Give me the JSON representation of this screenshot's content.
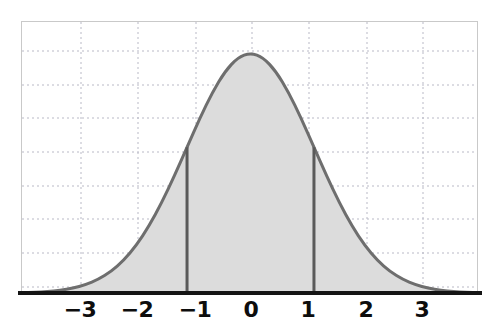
{
  "figure": {
    "kind": "normal-distribution-plot",
    "background_color": "#ffffff"
  },
  "chart_data": {
    "type": "area",
    "title": "",
    "subtitle": "",
    "xlabel": "",
    "ylabel": "",
    "xlim": [
      -3.6,
      3.6
    ],
    "ylim": [
      0.0,
      0.45
    ],
    "grid": true,
    "grid_style": "dotted",
    "grid_color": "#b9b9c6",
    "legend": "none",
    "curve": {
      "name": "standard normal density",
      "distribution": "normal",
      "mean": 0,
      "sd": 1,
      "line_color": "#6e6e6e",
      "line_width": 3,
      "fill_color": "#dcdcdc",
      "fill_from": -3.6,
      "fill_to": 3.6
    },
    "x": [
      -3.6,
      -3.4,
      -3.2,
      -3.0,
      -2.8,
      -2.6,
      -2.4,
      -2.2,
      -2.0,
      -1.8,
      -1.6,
      -1.4,
      -1.2,
      -1.0,
      -0.8,
      -0.6,
      -0.4,
      -0.2,
      0.0,
      0.2,
      0.4,
      0.6,
      0.8,
      1.0,
      1.2,
      1.4,
      1.6,
      1.8,
      2.0,
      2.2,
      2.4,
      2.6,
      2.8,
      3.0,
      3.2,
      3.4,
      3.6
    ],
    "y": [
      0.0006,
      0.0012,
      0.0024,
      0.0044,
      0.0079,
      0.0136,
      0.0224,
      0.0355,
      0.054,
      0.079,
      0.1109,
      0.1497,
      0.1942,
      0.242,
      0.2897,
      0.3332,
      0.3683,
      0.391,
      0.3989,
      0.391,
      0.3683,
      0.3332,
      0.2897,
      0.242,
      0.1942,
      0.1497,
      0.1109,
      0.079,
      0.054,
      0.0355,
      0.0224,
      0.0136,
      0.0079,
      0.0044,
      0.0024,
      0.0012,
      0.0006
    ],
    "x_ticks": [
      {
        "value": -3,
        "label": "−3"
      },
      {
        "value": -2,
        "label": "−2"
      },
      {
        "value": -1,
        "label": "−1"
      },
      {
        "value": 0,
        "label": "0"
      },
      {
        "value": 1,
        "label": "1"
      },
      {
        "value": 2,
        "label": "2"
      },
      {
        "value": 3,
        "label": "3"
      }
    ],
    "y_gridlines": [
      0.05,
      0.1,
      0.15,
      0.2,
      0.25,
      0.3,
      0.35,
      0.4
    ],
    "vertical_markers": [
      {
        "name": "sd-lower",
        "value": -1,
        "label": "−1",
        "color": "#5a5a5a",
        "width": 3,
        "top_y": 0.242
      },
      {
        "name": "sd-upper",
        "value": 1,
        "label": "1",
        "color": "#5a5a5a",
        "width": 3,
        "top_y": 0.242
      }
    ],
    "axis_line_color": "#141414",
    "tick_label_color": "#0d0d0d"
  },
  "x_tick_positions_px": [
    80,
    137,
    195,
    251,
    308,
    366,
    422
  ]
}
